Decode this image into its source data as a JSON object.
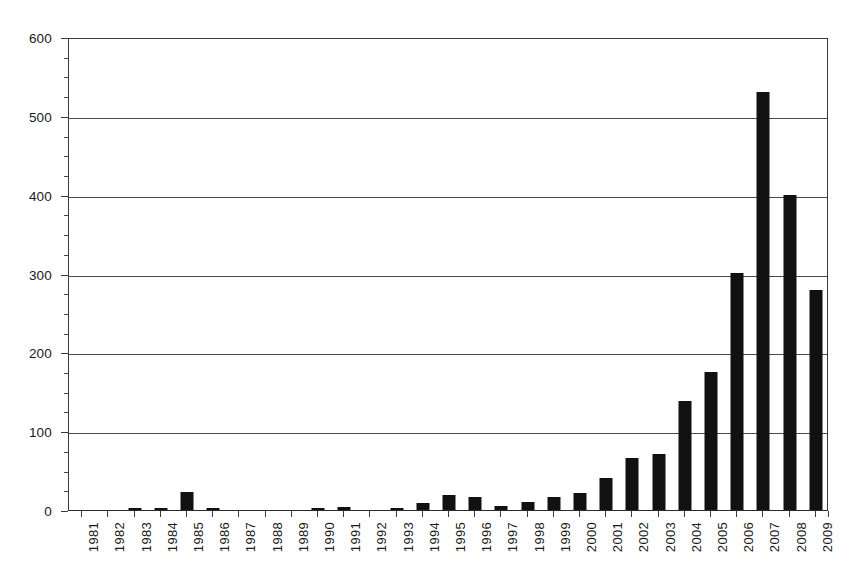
{
  "chart_data": {
    "type": "bar",
    "title": "",
    "subtitle": "",
    "xlabel": "",
    "ylabel": "",
    "ylim": [
      0,
      600
    ],
    "ytick_step": 100,
    "yticks": [
      0,
      100,
      200,
      300,
      400,
      500,
      600
    ],
    "ytick_labels": [
      "0",
      "100",
      "200",
      "300",
      "400",
      "500",
      "600"
    ],
    "minor_ytick_step": 25,
    "grid": true,
    "legend": null,
    "legend_position": "none",
    "bar_color": "#111111",
    "categories": [
      "1981",
      "1982",
      "1983",
      "1984",
      "1985",
      "1986",
      "1987",
      "1988",
      "1989",
      "1990",
      "1991",
      "1992",
      "1993",
      "1994",
      "1995",
      "1996",
      "1997",
      "1998",
      "1999",
      "2000",
      "2001",
      "2002",
      "2003",
      "2004",
      "2005",
      "2006",
      "2007",
      "2008",
      "2009"
    ],
    "values": [
      0,
      0,
      3,
      2,
      23,
      2,
      0,
      0,
      0,
      3,
      4,
      0,
      2,
      9,
      19,
      17,
      5,
      10,
      16,
      21,
      40,
      66,
      71,
      138,
      175,
      301,
      530,
      399,
      279
    ]
  }
}
